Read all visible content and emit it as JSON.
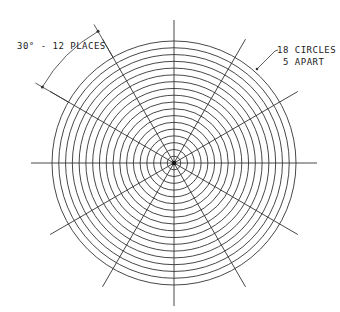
{
  "diagram": {
    "type": "polar-grid",
    "center": [
      174,
      163
    ],
    "outer_radius": 122,
    "circle_count": 18,
    "radial_line_count": 12,
    "radial_angle_deg": 30,
    "line_color": "#333333"
  },
  "annotations": {
    "angle_label": "30° - 12 PLACES",
    "circles_label_line1": "18 CIRCLES",
    "circles_label_line2": "5 APART"
  }
}
